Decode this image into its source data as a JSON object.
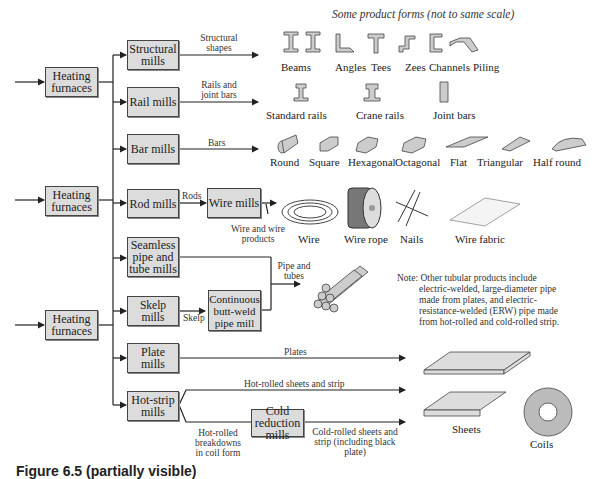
{
  "title": "Some product forms (not to same scale)",
  "furnaces": [
    {
      "label": "Heating furnaces"
    },
    {
      "label": "Heating furnaces"
    },
    {
      "label": "Heating furnaces"
    }
  ],
  "mills": {
    "structural": "Structural mills",
    "rail": "Rail mills",
    "bar": "Bar mills",
    "rod": "Rod mills",
    "wire": "Wire mills",
    "seamless": "Seamless pipe and tube mills",
    "skelp": "Skelp mills",
    "buttweld": "Continuous butt-weld pipe mill",
    "plate": "Plate mills",
    "hotstrip": "Hot-strip mills",
    "coldred": "Cold reduction mills"
  },
  "flows": {
    "structural_shapes": "Structural shapes",
    "rails_joint_bars": "Rails and joint bars",
    "bars": "Bars",
    "rods": "Rods",
    "wire_products": "Wire and wire products",
    "skelp": "Skelp",
    "pipe_tubes": "Pipe and tubes",
    "plates": "Plates",
    "hot_rolled_sheets": "Hot-rolled sheets and strip",
    "hot_rolled_breakdowns": "Hot-rolled breakdowns in coil form",
    "cold_rolled": "Cold-rolled sheets and strip (including black plate)"
  },
  "products": {
    "row1": [
      "Beams",
      "Angles",
      "Tees",
      "Zees",
      "Channels",
      "Piling"
    ],
    "row2": [
      "Standard rails",
      "Crane rails",
      "Joint bars"
    ],
    "row3": [
      "Round",
      "Square",
      "Hexagonal",
      "Octagonal",
      "Flat",
      "Triangular",
      "Half round"
    ],
    "row4": [
      "Wire",
      "Wire rope",
      "Nails",
      "Wire fabric"
    ],
    "sheets": "Sheets",
    "coils": "Coils"
  },
  "note": "Note: Other tubular products include electric-welded, large-diameter pipe made from plates, and electric-resistance-welded (ERW) pipe made from hot-rolled and cold-rolled strip.",
  "note_lines": [
    "Note: Other tubular products include",
    "electric-welded, large-diameter pipe",
    "made from plates, and electric-",
    "resistance-welded (ERW) pipe made",
    "from hot-rolled and cold-rolled strip."
  ],
  "caption": "Figure 6.5 (partially visible)"
}
